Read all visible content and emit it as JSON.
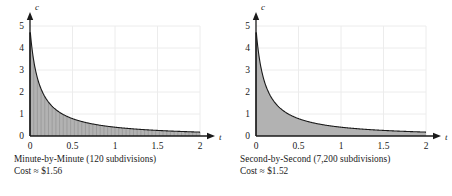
{
  "figure": {
    "panels": [
      {
        "id": "minute-by-minute",
        "caption_line1": "Minute-by-Minute (120 subdivisions)",
        "caption_line2": "Cost ≈ $1.56",
        "subdivisions": 120,
        "cost": "$1.56",
        "riemann_visible": true,
        "visible_stripes": 46
      },
      {
        "id": "second-by-second",
        "caption_line1": "Second-by-Second (7,200 subdivisions)",
        "caption_line2": "Cost ≈ $1.52",
        "subdivisions": 7200,
        "cost": "$1.52",
        "riemann_visible": false,
        "visible_stripes": 0
      }
    ]
  },
  "chart_data": [
    {
      "type": "area",
      "title": "Minute-by-Minute (120 subdivisions)",
      "subtitle": "Cost ≈ $1.56",
      "xlabel": "t",
      "ylabel": "c",
      "xlim": [
        0,
        2
      ],
      "ylim": [
        0,
        5
      ],
      "xticks": [
        0,
        0.5,
        1,
        1.5,
        2
      ],
      "xticklabels": [
        "0",
        "0.5",
        "1",
        "1.5",
        "2"
      ],
      "yticks": [
        0,
        1,
        2,
        3,
        4,
        5
      ],
      "yticklabels": [
        "0",
        "1",
        "2",
        "3",
        "4",
        "5"
      ],
      "grid": true,
      "legend": "none",
      "fill_color": "#b2b2b2",
      "curve_color": "#1a1a1a",
      "grid_color": "#ececec",
      "series": [
        {
          "name": "c(t)",
          "x": [
            0.01,
            0.05,
            0.1,
            0.15,
            0.2,
            0.25,
            0.3,
            0.4,
            0.5,
            0.6,
            0.7,
            0.8,
            0.9,
            1.0,
            1.1,
            1.2,
            1.3,
            1.4,
            1.5,
            1.6,
            1.7,
            1.8,
            1.9,
            2.0
          ],
          "y": [
            4.8,
            3.3,
            2.4,
            1.95,
            1.7,
            1.5,
            1.35,
            1.1,
            0.95,
            0.82,
            0.72,
            0.64,
            0.58,
            0.52,
            0.47,
            0.43,
            0.4,
            0.37,
            0.34,
            0.32,
            0.3,
            0.28,
            0.26,
            0.25
          ]
        }
      ],
      "annotations": [
        "Cost ≈ $1.56"
      ]
    },
    {
      "type": "area",
      "title": "Second-by-Second (7,200 subdivisions)",
      "subtitle": "Cost ≈ $1.52",
      "xlabel": "t",
      "ylabel": "c",
      "xlim": [
        0,
        2
      ],
      "ylim": [
        0,
        5
      ],
      "xticks": [
        0,
        0.5,
        1,
        1.5,
        2
      ],
      "xticklabels": [
        "0",
        "0.5",
        "1",
        "1.5",
        "2"
      ],
      "yticks": [
        0,
        1,
        2,
        3,
        4,
        5
      ],
      "yticklabels": [
        "0",
        "1",
        "2",
        "3",
        "4",
        "5"
      ],
      "grid": true,
      "legend": "none",
      "fill_color": "#b2b2b2",
      "curve_color": "#1a1a1a",
      "grid_color": "#ececec",
      "series": [
        {
          "name": "c(t)",
          "x": [
            0.01,
            0.05,
            0.1,
            0.15,
            0.2,
            0.25,
            0.3,
            0.4,
            0.5,
            0.6,
            0.7,
            0.8,
            0.9,
            1.0,
            1.1,
            1.2,
            1.3,
            1.4,
            1.5,
            1.6,
            1.7,
            1.8,
            1.9,
            2.0
          ],
          "y": [
            4.8,
            3.3,
            2.4,
            1.95,
            1.7,
            1.5,
            1.35,
            1.1,
            0.95,
            0.82,
            0.72,
            0.64,
            0.58,
            0.52,
            0.47,
            0.43,
            0.4,
            0.37,
            0.34,
            0.32,
            0.3,
            0.28,
            0.26,
            0.25
          ]
        }
      ],
      "annotations": [
        "Cost ≈ $1.52"
      ]
    }
  ]
}
